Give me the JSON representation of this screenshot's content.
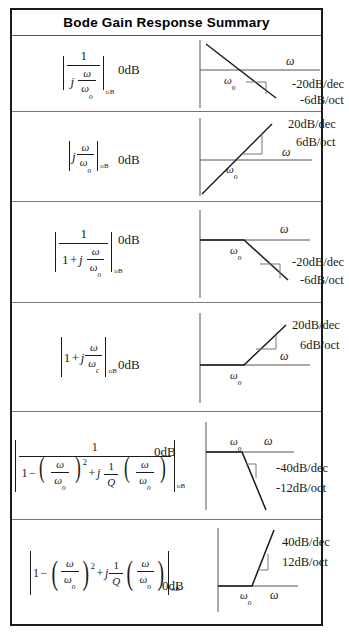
{
  "header": {
    "title": "Bode Gain Response Summary"
  },
  "labels": {
    "zero_db": "0dB",
    "omega": "ω",
    "omega_o": "ω",
    "omega_o_sub": "o",
    "omega_c_sub": "c",
    "db_subscript": "dB"
  },
  "rows": [
    {
      "id": "row-integrator",
      "formula_text": "| 1 / ( j ω/ωo ) |dB",
      "corner_label": "ωo",
      "axis_label": "ω",
      "zero_db": "0dB",
      "slope_dec": "-20dB/dec",
      "slope_oct": "-6dB/oct",
      "shape": "falling-line"
    },
    {
      "id": "row-differentiator",
      "formula_text": "| j ω/ωo |dB",
      "corner_label": "ωo",
      "axis_label": "ω",
      "zero_db": "0dB",
      "slope_dec": "20dB/dec",
      "slope_oct": "6dB/oct",
      "shape": "rising-line"
    },
    {
      "id": "row-lowpass-first-order",
      "formula_text": "| 1 / ( 1 + j ω/ωo ) |dB",
      "corner_label": "ωo",
      "axis_label": "ω",
      "zero_db": "0dB",
      "slope_dec": "-20dB/dec",
      "slope_oct": "-6dB/oct",
      "shape": "flat-then-falling"
    },
    {
      "id": "row-highpass-first-order",
      "formula_text": "| 1 + j ω/ωc |dB",
      "corner_label": "ωo",
      "axis_label": "ω",
      "zero_db": "0dB",
      "slope_dec": "20dB/dec",
      "slope_oct": "6dB/oct",
      "shape": "flat-then-rising"
    },
    {
      "id": "row-lowpass-second-order",
      "formula_text": "| 1 / ( 1 - (ω/ωo)² + j (1/Q)(ω/ωo) ) |dB",
      "corner_label": "ωo",
      "axis_label": "ω",
      "zero_db": "0dB",
      "slope_dec": "-40dB/dec",
      "slope_oct": "-12dB/oct",
      "shape": "flat-then-steep-falling"
    },
    {
      "id": "row-highpass-second-order",
      "formula_text": "| 1 - (ω/ωo)² + j (1/Q)(ω/ωo) |dB",
      "corner_label": "ωo",
      "axis_label": "ω",
      "zero_db": "0dB",
      "slope_dec": "40dB/dec",
      "slope_oct": "12dB/oct",
      "shape": "flat-then-steep-rising"
    }
  ],
  "math_tokens": {
    "one": "1",
    "j": "j",
    "Q": "Q",
    "plus": "+",
    "minus": "−",
    "two": "2",
    "open_paren": "(",
    "close_paren": ")"
  },
  "colors": {
    "ink": "#1a1a1a",
    "border": "#1a1a1a",
    "divider": "#777777",
    "axis": "#555555"
  }
}
